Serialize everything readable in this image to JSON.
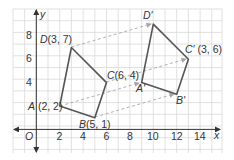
{
  "figure": {
    "type": "coordinate-plane-translation",
    "axes": {
      "x_label": "x",
      "y_label": "y",
      "origin_label": "O",
      "x_ticks": [
        "2",
        "4",
        "6",
        "8",
        "10",
        "12",
        "14"
      ],
      "y_ticks": [
        "4",
        "6",
        "8"
      ],
      "x_range": [
        -2,
        16
      ],
      "y_range": [
        -2,
        10
      ]
    },
    "preimage": {
      "points": [
        {
          "name": "A",
          "label": "A (2, 2)",
          "x": 2,
          "y": 2
        },
        {
          "name": "B",
          "label": "B(5, 1)",
          "x": 5,
          "y": 1
        },
        {
          "name": "C",
          "label": "C(6, 4)",
          "x": 6,
          "y": 4
        },
        {
          "name": "D",
          "label": "D(3, 7)",
          "x": 3,
          "y": 7
        }
      ]
    },
    "image": {
      "points": [
        {
          "name": "A'",
          "label": "A'",
          "x": 9,
          "y": 4
        },
        {
          "name": "B'",
          "label": "B'",
          "x": 12,
          "y": 3
        },
        {
          "name": "C'",
          "label": "C' (3, 6)",
          "x": 13,
          "y": 6
        },
        {
          "name": "D'",
          "label": "D'",
          "x": 10,
          "y": 9
        }
      ]
    },
    "colors": {
      "grid": "#d9d9d9",
      "axis": "#333333",
      "polygon": "#555555",
      "arrow": "#a6a6a6"
    }
  }
}
